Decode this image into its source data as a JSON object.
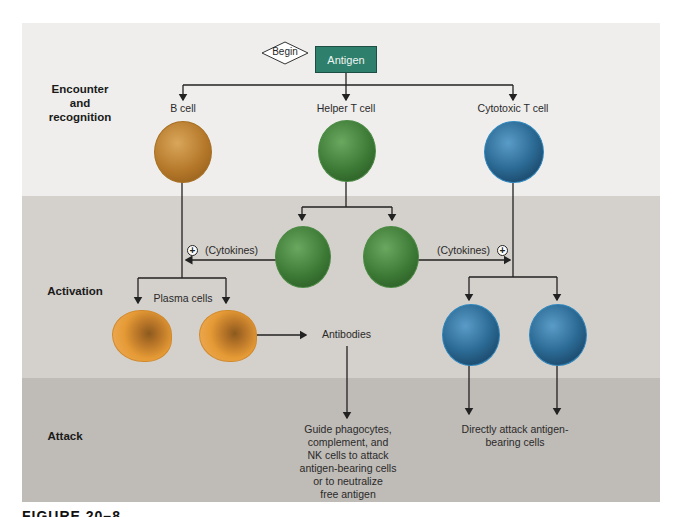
{
  "stages": {
    "encounter": "Encounter\nand\nrecognition",
    "activation": "Activation",
    "attack": "Attack"
  },
  "flow": {
    "begin": "Begin",
    "antigen": "Antigen"
  },
  "cells": {
    "b_cell": "B cell",
    "helper_t_cell": "Helper T cell",
    "cytotoxic_t_cell": "Cytotoxic T cell",
    "plasma_cells": "Plasma cells"
  },
  "signals": {
    "cytokines_left": "(Cytokines)",
    "cytokines_right": "(Cytokines)",
    "plus_symbol": "+",
    "antibodies": "Antibodies"
  },
  "outcomes": {
    "antibody_outcome": "Guide phagocytes,\ncomplement, and\nNK cells to attack\nantigen-bearing cells\nor to neutralize\nfree antigen",
    "cytotoxic_outcome": "Directly attack antigen-\nbearing cells"
  },
  "caption": {
    "text": "FIGURE 20–8"
  },
  "colors": {
    "band_top": "#efeeec",
    "band_mid": "#d4d0cb",
    "band_bot": "#bfbbb6",
    "antigen_box": "#2e7f6c",
    "b_cell": "#c98a2e",
    "helper_t": "#3f7f3a",
    "cytotoxic_t": "#3a8fc8",
    "plasma": "#e0922c"
  }
}
